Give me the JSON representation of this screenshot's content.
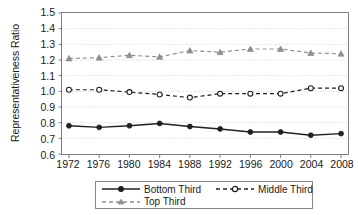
{
  "chart_data": {
    "type": "line",
    "title": "",
    "xlabel": "",
    "ylabel": "Representativeness Ratio",
    "x": [
      1972,
      1976,
      1980,
      1984,
      1988,
      1992,
      1996,
      2000,
      2004,
      2008
    ],
    "xtick_labels": [
      "1972",
      "1976",
      "1980",
      "1984",
      "1988",
      "1992",
      "1996",
      "2000",
      "2004",
      "2008"
    ],
    "ytick_labels": [
      "1.5",
      "1.4",
      "1.3",
      "1.2",
      "1.1",
      "1.0",
      "0.9",
      "0.8",
      "0.7",
      "0.6"
    ],
    "ytick_values": [
      1.5,
      1.4,
      1.3,
      1.2,
      1.1,
      1.0,
      0.9,
      0.8,
      0.7,
      0.6
    ],
    "ylim": [
      0.6,
      1.5
    ],
    "grid": true,
    "grid_axis": "y",
    "legend_position": "bottom",
    "series": [
      {
        "name": "Bottom Third",
        "values": [
          0.78,
          0.77,
          0.78,
          0.795,
          0.775,
          0.76,
          0.74,
          0.74,
          0.72,
          0.73
        ],
        "color": "#231f20",
        "line_style": "solid",
        "marker": "filled-circle"
      },
      {
        "name": "Middle Third",
        "values": [
          1.01,
          1.01,
          0.995,
          0.98,
          0.96,
          0.985,
          0.985,
          0.985,
          1.02,
          1.02
        ],
        "color": "#231f20",
        "line_style": "dashed",
        "marker": "open-circle"
      },
      {
        "name": "Top Third",
        "values": [
          1.21,
          1.215,
          1.23,
          1.22,
          1.26,
          1.25,
          1.27,
          1.27,
          1.245,
          1.24
        ],
        "color": "#8f8f8f",
        "line_style": "dashed",
        "marker": "filled-triangle"
      }
    ]
  },
  "legend": {
    "entries": [
      {
        "label": "Bottom Third"
      },
      {
        "label": "Middle Third"
      },
      {
        "label": "Top Third"
      }
    ]
  },
  "colors": {
    "axis": "#7d7d7d",
    "grid": "#c9c9c9",
    "text": "#1a1a1a",
    "dark_series": "#231f20",
    "light_series": "#8f8f8f"
  }
}
